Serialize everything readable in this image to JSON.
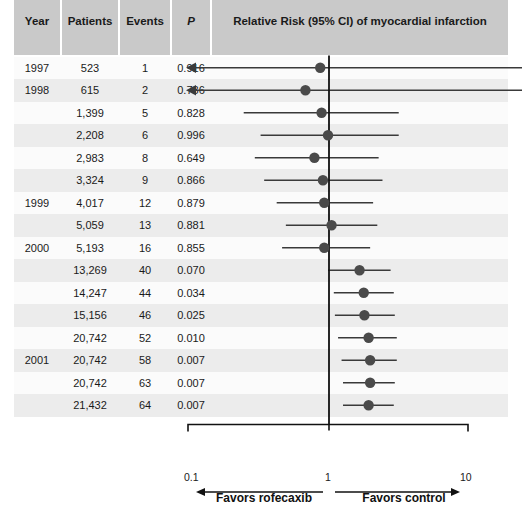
{
  "table": {
    "columns": [
      {
        "key": "year",
        "label": "Year"
      },
      {
        "key": "patients",
        "label": "Patients"
      },
      {
        "key": "events",
        "label": "Events"
      },
      {
        "key": "p",
        "label": "P"
      }
    ],
    "plot_header": "Relative Risk (95% CI) of myocardial infarction",
    "rows": [
      {
        "year": "1997",
        "patients": "523",
        "events": "1",
        "p": "0.916"
      },
      {
        "year": "1998",
        "patients": "615",
        "events": "2",
        "p": "0.736"
      },
      {
        "year": "",
        "patients": "1,399",
        "events": "5",
        "p": "0.828"
      },
      {
        "year": "",
        "patients": "2,208",
        "events": "6",
        "p": "0.996"
      },
      {
        "year": "",
        "patients": "2,983",
        "events": "8",
        "p": "0.649"
      },
      {
        "year": "",
        "patients": "3,324",
        "events": "9",
        "p": "0.866"
      },
      {
        "year": "1999",
        "patients": "4,017",
        "events": "12",
        "p": "0.879"
      },
      {
        "year": "",
        "patients": "5,059",
        "events": "13",
        "p": "0.881"
      },
      {
        "year": "2000",
        "patients": "5,193",
        "events": "16",
        "p": "0.855"
      },
      {
        "year": "",
        "patients": "13,269",
        "events": "40",
        "p": "0.070"
      },
      {
        "year": "",
        "patients": "14,247",
        "events": "44",
        "p": "0.034"
      },
      {
        "year": "",
        "patients": "15,156",
        "events": "46",
        "p": "0.025"
      },
      {
        "year": "",
        "patients": "20,742",
        "events": "52",
        "p": "0.010"
      },
      {
        "year": "2001",
        "patients": "20,742",
        "events": "58",
        "p": "0.007"
      },
      {
        "year": "",
        "patients": "20,742",
        "events": "63",
        "p": "0.007"
      },
      {
        "year": "",
        "patients": "21,432",
        "events": "64",
        "p": "0.007"
      }
    ]
  },
  "axis": {
    "tick_low": "0.1",
    "tick_mid": "1",
    "tick_high": "10",
    "favors_left": "Favors rofecaxib",
    "favors_right": "Favors control"
  },
  "colors": {
    "header_bg": "#c9c9c9",
    "row_alt": "#ececec",
    "row_norm": "#fbfbfb",
    "marker": "#4a4a4a",
    "line": "#3a3a3a",
    "axis": "#111111",
    "text": "#1a1a1a"
  },
  "chart_data": {
    "type": "scatter",
    "title": "Relative Risk (95% CI) of myocardial infarction",
    "xlabel": "Relative Risk",
    "ylabel": "",
    "xscale": "log",
    "xlim": [
      0.1,
      10
    ],
    "xticks": [
      0.1,
      1,
      10
    ],
    "xticklabels": [
      "0.1",
      "1",
      "10"
    ],
    "reference_line": 1,
    "grid": false,
    "legend": null,
    "annotations": [
      "Favors rofecaxib",
      "Favors control"
    ],
    "series_name": "Cumulative relative risk of myocardial infarction (rofecoxib vs control)",
    "points": [
      {
        "label": "1997 / 523 patients / 1 event",
        "rr": 0.88,
        "ci_low": 0.04,
        "ci_high": 10.0,
        "p": 0.916,
        "ci_low_clipped": true,
        "ci_high_clipped": true
      },
      {
        "label": "1998 / 615 patients / 2 events",
        "rr": 0.69,
        "ci_low": 0.04,
        "ci_high": 10.0,
        "p": 0.736,
        "ci_low_clipped": true,
        "ci_high_clipped": true
      },
      {
        "label": "1,399 patients / 5 events",
        "rr": 0.9,
        "ci_low": 0.25,
        "ci_high": 3.2,
        "p": 0.828,
        "ci_low_clipped": false,
        "ci_high_clipped": false
      },
      {
        "label": "2,208 patients / 6 events",
        "rr": 1.0,
        "ci_low": 0.33,
        "ci_high": 3.2,
        "p": 0.996,
        "ci_low_clipped": false,
        "ci_high_clipped": false
      },
      {
        "label": "2,983 patients / 8 events",
        "rr": 0.8,
        "ci_low": 0.3,
        "ci_high": 2.3,
        "p": 0.649,
        "ci_low_clipped": false,
        "ci_high_clipped": false
      },
      {
        "label": "3,324 patients / 9 events",
        "rr": 0.92,
        "ci_low": 0.35,
        "ci_high": 2.45,
        "p": 0.866,
        "ci_low_clipped": false,
        "ci_high_clipped": false
      },
      {
        "label": "1999 / 4,017 patients / 12 events",
        "rr": 0.94,
        "ci_low": 0.43,
        "ci_high": 2.1,
        "p": 0.879,
        "ci_low_clipped": false,
        "ci_high_clipped": false
      },
      {
        "label": "5,059 patients / 13 events",
        "rr": 1.06,
        "ci_low": 0.5,
        "ci_high": 2.25,
        "p": 0.881,
        "ci_low_clipped": false,
        "ci_high_clipped": false
      },
      {
        "label": "2000 / 5,193 patients / 16 events",
        "rr": 0.94,
        "ci_low": 0.47,
        "ci_high": 2.0,
        "p": 0.855,
        "ci_low_clipped": false,
        "ci_high_clipped": false
      },
      {
        "label": "13,269 patients / 40 events",
        "rr": 1.68,
        "ci_low": 1.0,
        "ci_high": 2.8,
        "p": 0.07,
        "ci_low_clipped": false,
        "ci_high_clipped": false
      },
      {
        "label": "14,247 patients / 44 events",
        "rr": 1.8,
        "ci_low": 1.1,
        "ci_high": 2.95,
        "p": 0.034,
        "ci_low_clipped": false,
        "ci_high_clipped": false
      },
      {
        "label": "15,156 patients / 46 events",
        "rr": 1.82,
        "ci_low": 1.12,
        "ci_high": 3.0,
        "p": 0.025,
        "ci_low_clipped": false,
        "ci_high_clipped": false
      },
      {
        "label": "20,742 patients / 52 events",
        "rr": 1.95,
        "ci_low": 1.18,
        "ci_high": 3.1,
        "p": 0.01,
        "ci_low_clipped": false,
        "ci_high_clipped": false
      },
      {
        "label": "2001 / 20,742 patients / 58 events",
        "rr": 2.0,
        "ci_low": 1.25,
        "ci_high": 3.1,
        "p": 0.007,
        "ci_low_clipped": false,
        "ci_high_clipped": false
      },
      {
        "label": "20,742 patients / 63 events",
        "rr": 2.0,
        "ci_low": 1.28,
        "ci_high": 3.0,
        "p": 0.007,
        "ci_low_clipped": false,
        "ci_high_clipped": false
      },
      {
        "label": "21,432 patients / 64 events",
        "rr": 1.95,
        "ci_low": 1.28,
        "ci_high": 2.95,
        "p": 0.007,
        "ci_low_clipped": false,
        "ci_high_clipped": false
      }
    ]
  }
}
